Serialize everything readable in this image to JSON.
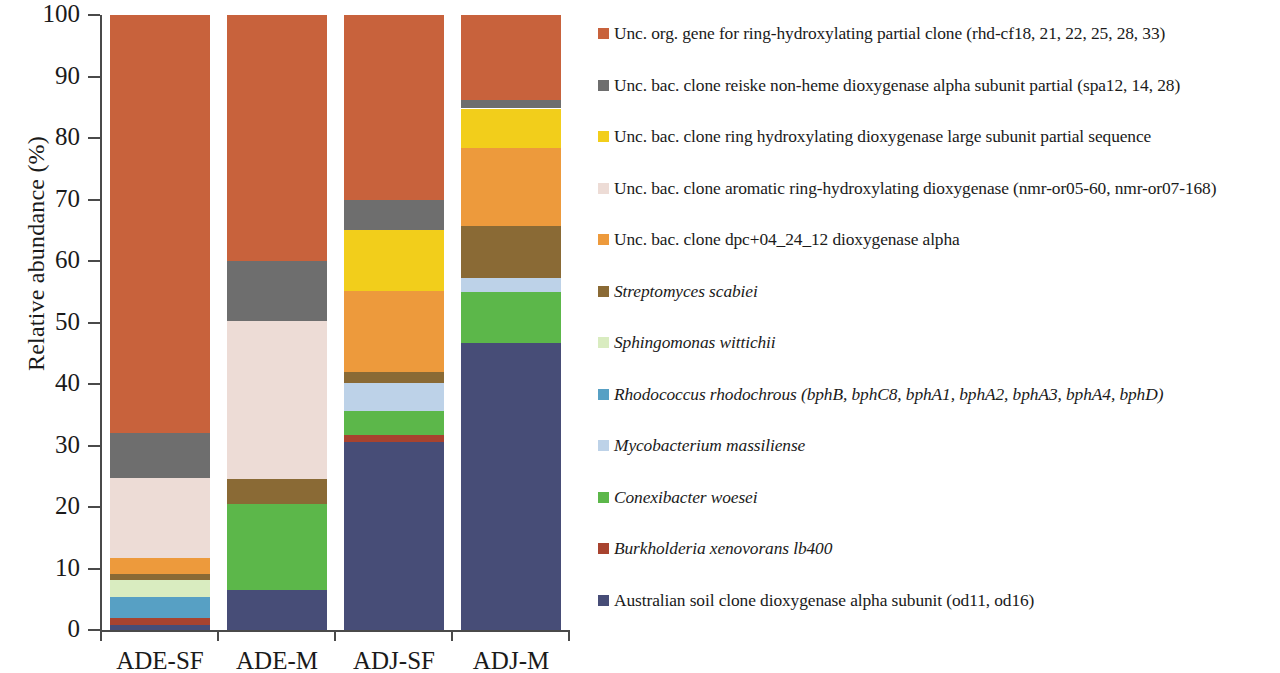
{
  "chart_data": {
    "type": "bar",
    "subtype": "stacked-100-percent",
    "title": "",
    "xlabel": "",
    "ylabel": "Relative abundance (%)",
    "ylim": [
      0,
      100
    ],
    "yticks": [
      0,
      10,
      20,
      30,
      40,
      50,
      60,
      70,
      80,
      90,
      100
    ],
    "grid": false,
    "legend_position": "right",
    "categories": [
      "ADE-SF",
      "ADE-M",
      "ADJ-SF",
      "ADJ-M"
    ],
    "series": [
      {
        "name": "Unc. org. gene for ring-hydroxylating partial clone (rhd-cf18, 21, 22, 25, 28, 33)",
        "color": "#c8623c",
        "values": [
          68.0,
          40.0,
          30.0,
          13.8
        ]
      },
      {
        "name": "Unc. bac. clone reiske non-heme dioxygenase alpha subunit partial (spa12, 14, 28)",
        "color": "#6e6e6e",
        "values": [
          7.3,
          9.7,
          5.0,
          1.4
        ]
      },
      {
        "name": "Unc. bac. clone ring hydroxylating dioxygenase large subunit partial sequence",
        "color": "#f2ce1b",
        "values": [
          0.0,
          0.0,
          9.8,
          6.5
        ]
      },
      {
        "name": "Unc. bac. clone aromatic ring-hydroxylating dioxygenase (nmr-or05-60, nmr-or07-168)",
        "color": "#eddcd6",
        "values": [
          13.0,
          25.8,
          0.0,
          0.0
        ]
      },
      {
        "name": "Unc. bac. clone dpc+04_24_12 dioxygenase alpha",
        "color": "#ed9a3c",
        "values": [
          2.6,
          0.0,
          13.2,
          12.6
        ]
      },
      {
        "name": "Streptomyces scabiei",
        "color": "#8a6a35",
        "values": [
          1.0,
          4.0,
          1.9,
          8.5
        ],
        "italic": true
      },
      {
        "name": "Sphingomonas wittichii",
        "color": "#d9ecc0",
        "values": [
          2.8,
          0.0,
          0.0,
          0.0
        ],
        "italic": true
      },
      {
        "name": "Rhodococcus rhodochrous  (bphB, bphC8, bphA1, bphA2, bphA3, bphA4, bphD)",
        "color": "#57a0c4",
        "values": [
          3.3,
          0.0,
          0.0,
          0.0
        ],
        "italic": true
      },
      {
        "name": "Mycobacterium massiliense",
        "color": "#bdd2e8",
        "values": [
          0.0,
          0.0,
          4.5,
          2.3
        ],
        "italic": true
      },
      {
        "name": "Conexibacter woesei",
        "color": "#5cb74a",
        "values": [
          0.0,
          14.0,
          3.9,
          8.3
        ],
        "italic": true
      },
      {
        "name": "Burkholderia xenovorans lb400",
        "color": "#a8432f",
        "values": [
          1.2,
          0.0,
          1.2,
          0.0
        ],
        "italic": true
      },
      {
        "name": "Australian soil clone dioxygenase alpha subunit (od11, od16)",
        "color": "#474d77",
        "values": [
          0.8,
          6.5,
          30.5,
          46.6
        ]
      }
    ]
  },
  "axis": {
    "y_title": "Relative abundance  (%)"
  }
}
